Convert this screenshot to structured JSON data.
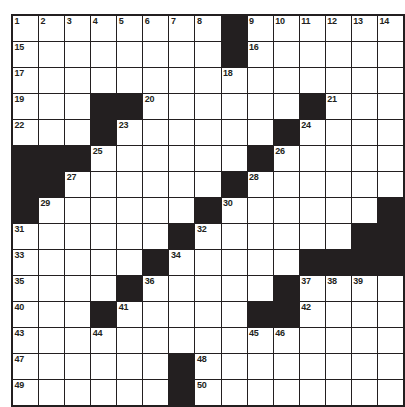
{
  "puzzle": {
    "title": "Crossword Grid",
    "type": "crossword",
    "rows": 15,
    "cols": 14,
    "colors": {
      "block": "#231f20",
      "cell": "#ffffff",
      "grid_line": "#231f20",
      "number": "#231f20",
      "background": "#ffffff"
    },
    "grid": [
      [
        {
          "block": false,
          "num": "1"
        },
        {
          "block": false,
          "num": "2"
        },
        {
          "block": false,
          "num": "3"
        },
        {
          "block": false,
          "num": "4"
        },
        {
          "block": false,
          "num": "5"
        },
        {
          "block": false,
          "num": "6"
        },
        {
          "block": false,
          "num": "7"
        },
        {
          "block": false,
          "num": "8"
        },
        {
          "block": true,
          "num": ""
        },
        {
          "block": false,
          "num": "9"
        },
        {
          "block": false,
          "num": "10"
        },
        {
          "block": false,
          "num": "11"
        },
        {
          "block": false,
          "num": "12"
        },
        {
          "block": false,
          "num": "13"
        },
        {
          "block": false,
          "num": "14"
        }
      ],
      [
        {
          "block": false,
          "num": "15"
        },
        {
          "block": false,
          "num": ""
        },
        {
          "block": false,
          "num": ""
        },
        {
          "block": false,
          "num": ""
        },
        {
          "block": false,
          "num": ""
        },
        {
          "block": false,
          "num": ""
        },
        {
          "block": false,
          "num": ""
        },
        {
          "block": false,
          "num": ""
        },
        {
          "block": true,
          "num": ""
        },
        {
          "block": false,
          "num": "16"
        },
        {
          "block": false,
          "num": ""
        },
        {
          "block": false,
          "num": ""
        },
        {
          "block": false,
          "num": ""
        },
        {
          "block": false,
          "num": ""
        },
        {
          "block": false,
          "num": ""
        }
      ],
      [
        {
          "block": false,
          "num": "17"
        },
        {
          "block": false,
          "num": ""
        },
        {
          "block": false,
          "num": ""
        },
        {
          "block": false,
          "num": ""
        },
        {
          "block": false,
          "num": ""
        },
        {
          "block": false,
          "num": ""
        },
        {
          "block": false,
          "num": ""
        },
        {
          "block": false,
          "num": ""
        },
        {
          "block": false,
          "num": "18"
        },
        {
          "block": false,
          "num": ""
        },
        {
          "block": false,
          "num": ""
        },
        {
          "block": false,
          "num": ""
        },
        {
          "block": false,
          "num": ""
        },
        {
          "block": false,
          "num": ""
        },
        {
          "block": false,
          "num": ""
        }
      ],
      [
        {
          "block": false,
          "num": "19"
        },
        {
          "block": false,
          "num": ""
        },
        {
          "block": false,
          "num": ""
        },
        {
          "block": true,
          "num": ""
        },
        {
          "block": true,
          "num": ""
        },
        {
          "block": false,
          "num": "20"
        },
        {
          "block": false,
          "num": ""
        },
        {
          "block": false,
          "num": ""
        },
        {
          "block": false,
          "num": ""
        },
        {
          "block": false,
          "num": ""
        },
        {
          "block": false,
          "num": ""
        },
        {
          "block": true,
          "num": ""
        },
        {
          "block": false,
          "num": "21"
        },
        {
          "block": false,
          "num": ""
        },
        {
          "block": false,
          "num": ""
        }
      ],
      [
        {
          "block": false,
          "num": "22"
        },
        {
          "block": false,
          "num": ""
        },
        {
          "block": false,
          "num": ""
        },
        {
          "block": true,
          "num": ""
        },
        {
          "block": false,
          "num": "23"
        },
        {
          "block": false,
          "num": ""
        },
        {
          "block": false,
          "num": ""
        },
        {
          "block": false,
          "num": ""
        },
        {
          "block": false,
          "num": ""
        },
        {
          "block": false,
          "num": ""
        },
        {
          "block": true,
          "num": ""
        },
        {
          "block": false,
          "num": "24"
        },
        {
          "block": false,
          "num": ""
        },
        {
          "block": false,
          "num": ""
        },
        {
          "block": false,
          "num": ""
        }
      ],
      [
        {
          "block": true,
          "num": ""
        },
        {
          "block": true,
          "num": ""
        },
        {
          "block": true,
          "num": ""
        },
        {
          "block": false,
          "num": "25"
        },
        {
          "block": false,
          "num": ""
        },
        {
          "block": false,
          "num": ""
        },
        {
          "block": false,
          "num": ""
        },
        {
          "block": false,
          "num": ""
        },
        {
          "block": false,
          "num": ""
        },
        {
          "block": true,
          "num": ""
        },
        {
          "block": false,
          "num": "26"
        },
        {
          "block": false,
          "num": ""
        },
        {
          "block": false,
          "num": ""
        },
        {
          "block": false,
          "num": ""
        },
        {
          "block": false,
          "num": ""
        }
      ],
      [
        {
          "block": true,
          "num": ""
        },
        {
          "block": true,
          "num": ""
        },
        {
          "block": false,
          "num": "27"
        },
        {
          "block": false,
          "num": ""
        },
        {
          "block": false,
          "num": ""
        },
        {
          "block": false,
          "num": ""
        },
        {
          "block": false,
          "num": ""
        },
        {
          "block": false,
          "num": ""
        },
        {
          "block": true,
          "num": ""
        },
        {
          "block": false,
          "num": "28"
        },
        {
          "block": false,
          "num": ""
        },
        {
          "block": false,
          "num": ""
        },
        {
          "block": false,
          "num": ""
        },
        {
          "block": false,
          "num": ""
        },
        {
          "block": false,
          "num": ""
        }
      ],
      [
        {
          "block": true,
          "num": ""
        },
        {
          "block": false,
          "num": "29"
        },
        {
          "block": false,
          "num": ""
        },
        {
          "block": false,
          "num": ""
        },
        {
          "block": false,
          "num": ""
        },
        {
          "block": false,
          "num": ""
        },
        {
          "block": false,
          "num": ""
        },
        {
          "block": true,
          "num": ""
        },
        {
          "block": false,
          "num": "30"
        },
        {
          "block": false,
          "num": ""
        },
        {
          "block": false,
          "num": ""
        },
        {
          "block": false,
          "num": ""
        },
        {
          "block": false,
          "num": ""
        },
        {
          "block": false,
          "num": ""
        },
        {
          "block": true,
          "num": ""
        }
      ],
      [
        {
          "block": false,
          "num": "31"
        },
        {
          "block": false,
          "num": ""
        },
        {
          "block": false,
          "num": ""
        },
        {
          "block": false,
          "num": ""
        },
        {
          "block": false,
          "num": ""
        },
        {
          "block": false,
          "num": ""
        },
        {
          "block": true,
          "num": ""
        },
        {
          "block": false,
          "num": "32"
        },
        {
          "block": false,
          "num": ""
        },
        {
          "block": false,
          "num": ""
        },
        {
          "block": false,
          "num": ""
        },
        {
          "block": false,
          "num": ""
        },
        {
          "block": false,
          "num": ""
        },
        {
          "block": true,
          "num": ""
        },
        {
          "block": true,
          "num": ""
        }
      ],
      [
        {
          "block": false,
          "num": "33"
        },
        {
          "block": false,
          "num": ""
        },
        {
          "block": false,
          "num": ""
        },
        {
          "block": false,
          "num": ""
        },
        {
          "block": false,
          "num": ""
        },
        {
          "block": true,
          "num": ""
        },
        {
          "block": false,
          "num": "34"
        },
        {
          "block": false,
          "num": ""
        },
        {
          "block": false,
          "num": ""
        },
        {
          "block": false,
          "num": ""
        },
        {
          "block": false,
          "num": ""
        },
        {
          "block": true,
          "num": ""
        },
        {
          "block": true,
          "num": ""
        },
        {
          "block": true,
          "num": ""
        },
        {
          "block": true,
          "num": ""
        }
      ],
      [
        {
          "block": false,
          "num": "35"
        },
        {
          "block": false,
          "num": ""
        },
        {
          "block": false,
          "num": ""
        },
        {
          "block": false,
          "num": ""
        },
        {
          "block": true,
          "num": ""
        },
        {
          "block": false,
          "num": "36"
        },
        {
          "block": false,
          "num": ""
        },
        {
          "block": false,
          "num": ""
        },
        {
          "block": false,
          "num": ""
        },
        {
          "block": false,
          "num": ""
        },
        {
          "block": true,
          "num": ""
        },
        {
          "block": false,
          "num": "37"
        },
        {
          "block": false,
          "num": "38"
        },
        {
          "block": false,
          "num": "39"
        },
        {
          "block": false,
          "num": ""
        }
      ],
      [
        {
          "block": false,
          "num": "40"
        },
        {
          "block": false,
          "num": ""
        },
        {
          "block": false,
          "num": ""
        },
        {
          "block": true,
          "num": ""
        },
        {
          "block": false,
          "num": "41"
        },
        {
          "block": false,
          "num": ""
        },
        {
          "block": false,
          "num": ""
        },
        {
          "block": false,
          "num": ""
        },
        {
          "block": false,
          "num": ""
        },
        {
          "block": true,
          "num": ""
        },
        {
          "block": true,
          "num": ""
        },
        {
          "block": false,
          "num": "42"
        },
        {
          "block": false,
          "num": ""
        },
        {
          "block": false,
          "num": ""
        },
        {
          "block": false,
          "num": ""
        }
      ],
      [
        {
          "block": false,
          "num": "43"
        },
        {
          "block": false,
          "num": ""
        },
        {
          "block": false,
          "num": ""
        },
        {
          "block": false,
          "num": "44"
        },
        {
          "block": false,
          "num": ""
        },
        {
          "block": false,
          "num": ""
        },
        {
          "block": false,
          "num": ""
        },
        {
          "block": false,
          "num": ""
        },
        {
          "block": false,
          "num": ""
        },
        {
          "block": false,
          "num": "45"
        },
        {
          "block": false,
          "num": "46"
        },
        {
          "block": false,
          "num": ""
        },
        {
          "block": false,
          "num": ""
        },
        {
          "block": false,
          "num": ""
        },
        {
          "block": false,
          "num": ""
        }
      ],
      [
        {
          "block": false,
          "num": "47"
        },
        {
          "block": false,
          "num": ""
        },
        {
          "block": false,
          "num": ""
        },
        {
          "block": false,
          "num": ""
        },
        {
          "block": false,
          "num": ""
        },
        {
          "block": false,
          "num": ""
        },
        {
          "block": true,
          "num": ""
        },
        {
          "block": false,
          "num": "48"
        },
        {
          "block": false,
          "num": ""
        },
        {
          "block": false,
          "num": ""
        },
        {
          "block": false,
          "num": ""
        },
        {
          "block": false,
          "num": ""
        },
        {
          "block": false,
          "num": ""
        },
        {
          "block": false,
          "num": ""
        },
        {
          "block": false,
          "num": ""
        }
      ],
      [
        {
          "block": false,
          "num": "49"
        },
        {
          "block": false,
          "num": ""
        },
        {
          "block": false,
          "num": ""
        },
        {
          "block": false,
          "num": ""
        },
        {
          "block": false,
          "num": ""
        },
        {
          "block": false,
          "num": ""
        },
        {
          "block": true,
          "num": ""
        },
        {
          "block": false,
          "num": "50"
        },
        {
          "block": false,
          "num": ""
        },
        {
          "block": false,
          "num": ""
        },
        {
          "block": false,
          "num": ""
        },
        {
          "block": false,
          "num": ""
        },
        {
          "block": false,
          "num": ""
        },
        {
          "block": false,
          "num": ""
        },
        {
          "block": false,
          "num": ""
        }
      ]
    ]
  }
}
